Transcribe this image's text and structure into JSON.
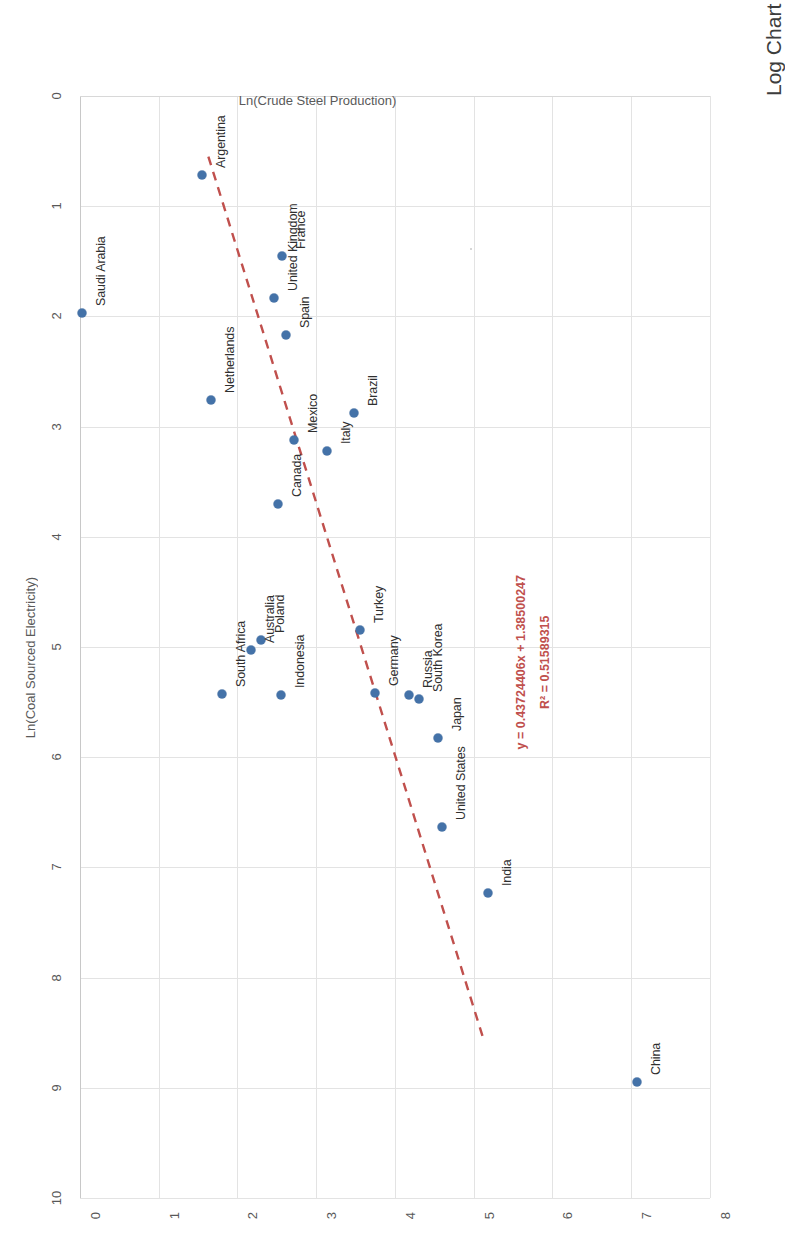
{
  "chart_data": {
    "type": "scatter",
    "title": "Log Chart of Coal Electricity versus Crude Steel Output",
    "xlabel": "Ln(Coal Sourced Electricity)",
    "ylabel": "Ln(Crude Steel Production)",
    "xlim": [
      0,
      10
    ],
    "ylim": [
      0,
      8
    ],
    "xticks": [
      "0",
      "1",
      "2",
      "3",
      "4",
      "5",
      "6",
      "7",
      "8",
      "9",
      "10"
    ],
    "yticks": [
      "0",
      "1",
      "2",
      "3",
      "4",
      "5",
      "6",
      "7",
      "8"
    ],
    "grid": true,
    "legend": "none",
    "series_name": "Countries",
    "point_color": "#4472a8",
    "trendline_color": "#c0504d",
    "trendline_style": "dashed",
    "annotations": {
      "equation": "y = 0.43724406x + 1.38500247",
      "r_squared": "R² = 0.51589315"
    },
    "trendline": {
      "x_start": 0.55,
      "y_start": 1.63,
      "x_end": 8.55,
      "y_end": 5.12
    },
    "points": [
      {
        "label": "China",
        "x": 8.95,
        "y": 7.07
      },
      {
        "label": "India",
        "x": 7.23,
        "y": 5.18
      },
      {
        "label": "United States",
        "x": 6.63,
        "y": 4.6
      },
      {
        "label": "Japan",
        "x": 5.83,
        "y": 4.55
      },
      {
        "label": "Russia",
        "x": 5.44,
        "y": 4.18
      },
      {
        "label": "South Korea",
        "x": 5.47,
        "y": 4.3
      },
      {
        "label": "Germany",
        "x": 5.42,
        "y": 3.75
      },
      {
        "label": "Turkey",
        "x": 4.85,
        "y": 3.55
      },
      {
        "label": "Indonesia",
        "x": 5.44,
        "y": 2.55
      },
      {
        "label": "South Africa",
        "x": 5.43,
        "y": 1.8
      },
      {
        "label": "Poland",
        "x": 4.94,
        "y": 2.3
      },
      {
        "label": "Australia",
        "x": 5.03,
        "y": 2.17
      },
      {
        "label": "Brazil",
        "x": 2.88,
        "y": 3.48
      },
      {
        "label": "Italy",
        "x": 3.22,
        "y": 3.14
      },
      {
        "label": "Mexico",
        "x": 3.12,
        "y": 2.72
      },
      {
        "label": "Canada",
        "x": 3.7,
        "y": 2.52
      },
      {
        "label": "France",
        "x": 1.45,
        "y": 2.56
      },
      {
        "label": "Spain",
        "x": 2.17,
        "y": 2.62
      },
      {
        "label": "United Kingdom",
        "x": 1.83,
        "y": 2.47
      },
      {
        "label": "Netherlands",
        "x": 2.76,
        "y": 1.66
      },
      {
        "label": "Argentina",
        "x": 0.72,
        "y": 1.55
      },
      {
        "label": "Saudi Arabia",
        "x": 1.97,
        "y": 0.02
      }
    ]
  }
}
